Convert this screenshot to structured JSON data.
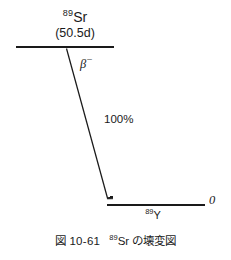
{
  "figure": {
    "type": "nuclear-decay-scheme",
    "background_color": "#ffffff",
    "ink_color": "#1a1a1a",
    "parent": {
      "mass_number": "89",
      "element": "Sr",
      "half_life": "(50.5d)"
    },
    "transition": {
      "mode_symbol": "β",
      "mode_charge": "−",
      "branching": "100%"
    },
    "daughter": {
      "mass_number": "89",
      "element": "Y",
      "energy": "0"
    },
    "caption": {
      "number": "図 10-61",
      "mass_number": "89",
      "text": "Sr の壊変図"
    }
  }
}
